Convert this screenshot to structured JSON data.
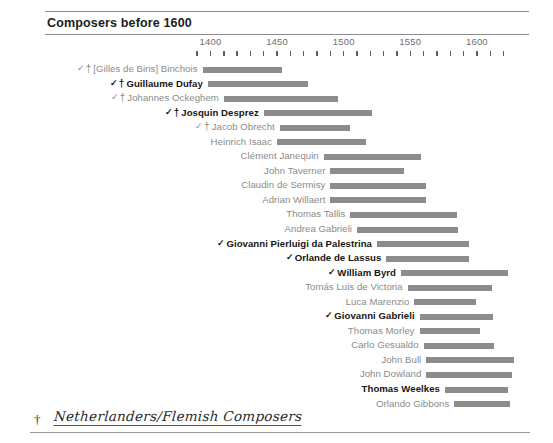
{
  "header": {
    "title": "Composers before 1600"
  },
  "axis": {
    "labels": [
      "1400",
      "1450",
      "1500",
      "1550",
      "1600"
    ],
    "label_years": [
      1400,
      1450,
      1500,
      1550,
      1600
    ],
    "tick_start_year": 1390,
    "tick_end_year": 1620,
    "tick_step": 10
  },
  "legend": {
    "dagger_symbol": "†",
    "footnote_text": "Netherlanders/Flemish Composers"
  },
  "marks": {
    "check": "✓",
    "dagger": "†"
  },
  "chart_data": {
    "type": "bar",
    "title": "Composers before 1600",
    "xlabel": "",
    "ylabel": "",
    "xlim": [
      1385,
      1635
    ],
    "grid": false,
    "legend_position": "bottom-left",
    "orientation": "horizontal-timeline",
    "axis_ticks": [
      1400,
      1450,
      1500,
      1550,
      1600
    ],
    "minor_tick_step": 10,
    "bar_color": "#8c8c8c",
    "categories": [
      "[Gilles de Bins] Binchois",
      "Guillaume Dufay",
      "Johannes Ockeghem",
      "Josquin Desprez",
      "Jacob Obrecht",
      "Heinrich Isaac",
      "Clément Janequin",
      "John Taverner",
      "Claudin de Sermisy",
      "Adrian Willaert",
      "Thomas Tallis",
      "Andrea Gabrieli",
      "Giovanni Pierluigi da Palestrina",
      "Orlande de Lassus",
      "William Byrd",
      "Tomás Luis de Victoria",
      "Luca Marenzio",
      "Giovanni Gabrieli",
      "Thomas Morley",
      "Carlo Gesualdo",
      "John Bull",
      "John Dowland",
      "Thomas Weelkes",
      "Orlando Gibbons"
    ],
    "series": [
      {
        "name": "lifespan",
        "spans": [
          {
            "label": "[Gilles de Bins] Binchois",
            "start": 1394,
            "end": 1454,
            "bold": false,
            "check": true,
            "dagger": true
          },
          {
            "label": "Guillaume Dufay",
            "start": 1398,
            "end": 1473,
            "bold": true,
            "check": true,
            "dagger": true
          },
          {
            "label": "Johannes Ockeghem",
            "start": 1410,
            "end": 1496,
            "bold": false,
            "check": true,
            "dagger": true
          },
          {
            "label": "Josquin Desprez",
            "start": 1440,
            "end": 1521,
            "bold": true,
            "check": true,
            "dagger": true
          },
          {
            "label": "Jacob Obrecht",
            "start": 1452,
            "end": 1505,
            "bold": false,
            "check": true,
            "dagger": true
          },
          {
            "label": "Heinrich Isaac",
            "start": 1450,
            "end": 1517,
            "bold": false,
            "check": false,
            "dagger": false
          },
          {
            "label": "Clément Janequin",
            "start": 1485,
            "end": 1558,
            "bold": false,
            "check": false,
            "dagger": false
          },
          {
            "label": "John Taverner",
            "start": 1490,
            "end": 1545,
            "bold": false,
            "check": false,
            "dagger": false
          },
          {
            "label": "Claudin de Sermisy",
            "start": 1490,
            "end": 1562,
            "bold": false,
            "check": false,
            "dagger": false
          },
          {
            "label": "Adrian Willaert",
            "start": 1490,
            "end": 1562,
            "bold": false,
            "check": false,
            "dagger": false
          },
          {
            "label": "Thomas Tallis",
            "start": 1505,
            "end": 1585,
            "bold": false,
            "check": false,
            "dagger": false
          },
          {
            "label": "Andrea Gabrieli",
            "start": 1510,
            "end": 1586,
            "bold": false,
            "check": false,
            "dagger": false
          },
          {
            "label": "Giovanni Pierluigi da Palestrina",
            "start": 1525,
            "end": 1594,
            "bold": true,
            "check": true,
            "dagger": false
          },
          {
            "label": "Orlande de Lassus",
            "start": 1532,
            "end": 1594,
            "bold": true,
            "check": true,
            "dagger": false
          },
          {
            "label": "William Byrd",
            "start": 1543,
            "end": 1623,
            "bold": true,
            "check": true,
            "dagger": false
          },
          {
            "label": "Tomás Luis de Victoria",
            "start": 1548,
            "end": 1611,
            "bold": false,
            "check": false,
            "dagger": false
          },
          {
            "label": "Luca Marenzio",
            "start": 1553,
            "end": 1599,
            "bold": false,
            "check": false,
            "dagger": false
          },
          {
            "label": "Giovanni Gabrieli",
            "start": 1557,
            "end": 1612,
            "bold": true,
            "check": true,
            "dagger": false
          },
          {
            "label": "Thomas Morley",
            "start": 1557,
            "end": 1602,
            "bold": false,
            "check": false,
            "dagger": false
          },
          {
            "label": "Carlo Gesualdo",
            "start": 1560,
            "end": 1613,
            "bold": false,
            "check": false,
            "dagger": false
          },
          {
            "label": "John Bull",
            "start": 1562,
            "end": 1628,
            "bold": false,
            "check": false,
            "dagger": false
          },
          {
            "label": "John Dowland",
            "start": 1562,
            "end": 1626,
            "bold": false,
            "check": false,
            "dagger": false
          },
          {
            "label": "Thomas Weelkes",
            "start": 1576,
            "end": 1623,
            "bold": true,
            "check": false,
            "dagger": false
          },
          {
            "label": "Orlando Gibbons",
            "start": 1583,
            "end": 1625,
            "bold": false,
            "check": false,
            "dagger": false
          }
        ]
      }
    ]
  }
}
